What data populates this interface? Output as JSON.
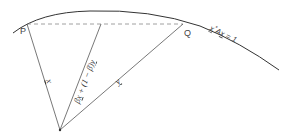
{
  "diagram": {
    "curve_label": "x*Ax = 1",
    "curve_label_parts": {
      "x": "x",
      "star": "*",
      "A": "A",
      "x2": "x",
      "eq": " = 1"
    },
    "point_p": "P",
    "point_q": "Q",
    "vector_x": "x",
    "vector_y": "y",
    "combination_label": "βx + (1 − β)y",
    "combination_parts": {
      "beta1": "β",
      "x": "x",
      "plus": " + (1 − ",
      "beta2": "β",
      "close": ")",
      "y": "y"
    },
    "colors": {
      "line": "#555555",
      "curve": "#333333",
      "dashed": "#888888",
      "text": "#333333"
    }
  }
}
